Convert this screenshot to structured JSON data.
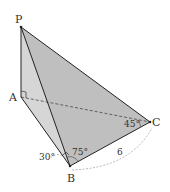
{
  "diagram": {
    "type": "tetrahedron",
    "points": {
      "P": {
        "label": "P",
        "x": 21,
        "y": 27
      },
      "A": {
        "label": "A",
        "x": 21,
        "y": 97
      },
      "B": {
        "label": "B",
        "x": 70,
        "y": 166
      },
      "C": {
        "label": "C",
        "x": 150,
        "y": 122
      }
    },
    "angles": {
      "angle_ABx": "30°",
      "angle_PBC": "75°",
      "angle_ACB": "45°"
    },
    "lengths": {
      "BC": "6"
    },
    "colors": {
      "face_pab": "#d6d6d6",
      "face_pbc": "#bfbfbf",
      "edge": "#222222",
      "dashed": "#555555",
      "arc": "#999999"
    }
  }
}
